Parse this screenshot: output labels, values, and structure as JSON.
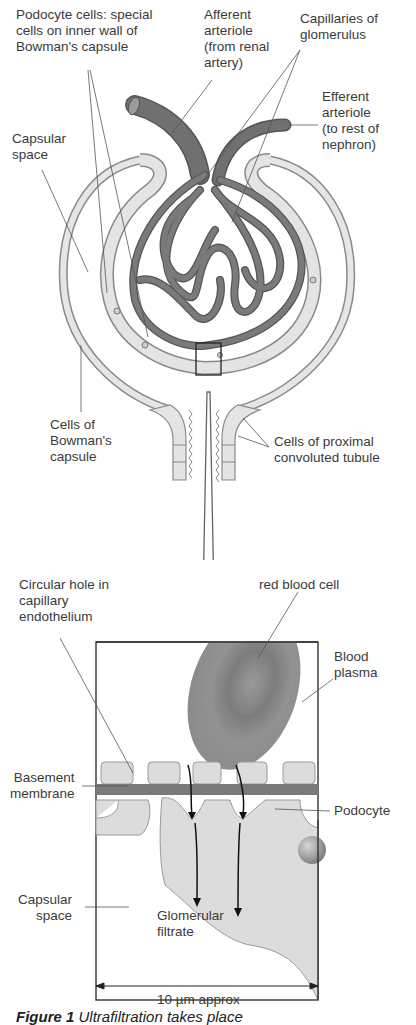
{
  "diagram": {
    "top_labels": {
      "podocyte_cells": "Podocyte cells: special\ncells on inner wall of\nBowman's capsule",
      "afferent_arteriole": "Afferent\narteriole\n(from renal\nartery)",
      "capillaries": "Capillaries of\nglomerulus",
      "efferent_arteriole": "Efferent\narteriole\n(to rest of\nnephron)",
      "capsular_space": "Capsular\nspace",
      "bowmans_cells": "Cells of\nBowman's\ncapsule",
      "proximal_cells": "Cells of proximal\nconvoluted tubule"
    },
    "detail_labels": {
      "circular_hole": "Circular hole in\ncapillary\nendothelium",
      "red_blood_cell": "red blood cell",
      "blood_plasma": "Blood\nplasma",
      "basement_membrane": "Basement\nmembrane",
      "podocyte": "Podocyte",
      "capsular_space": "Capsular\nspace",
      "glomerular_filtrate": "Glomerular\nfiltrate"
    },
    "scale_bar": "10 µm approx",
    "caption": {
      "figure": "Figure 1",
      "text": "Ultrafiltration takes place"
    },
    "colors": {
      "capillary": "#6e6e6e",
      "capsule_fill": "#e4e4e4",
      "outline": "#8a8a8a",
      "rbc": "#8c8c8c",
      "membrane": "#7a7a7a",
      "line": "#444444"
    }
  }
}
